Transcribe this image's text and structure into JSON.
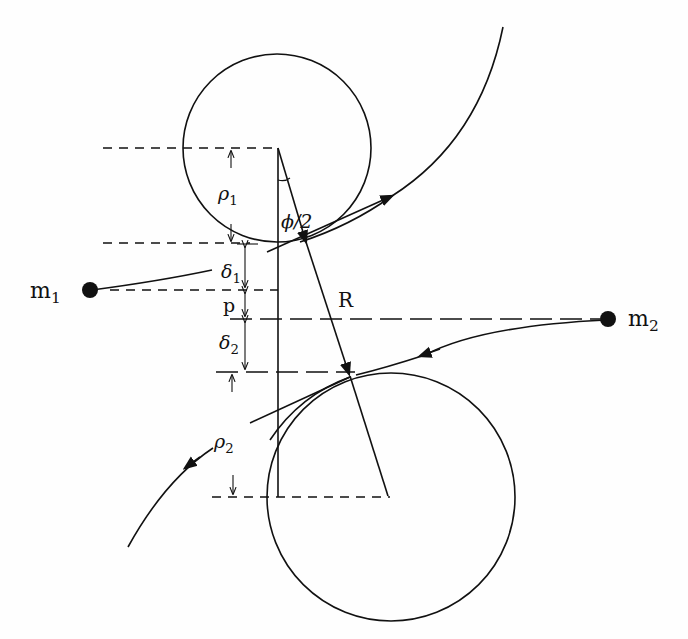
{
  "diagram": {
    "type": "two-body hyperbolic scattering geometry",
    "labels": {
      "m1": {
        "base": "m",
        "sub": "1"
      },
      "m2": {
        "base": "m",
        "sub": "2"
      },
      "rho1": {
        "base": "ρ",
        "sub": "1"
      },
      "rho2": {
        "base": "ρ",
        "sub": "2"
      },
      "delta1": {
        "base": "δ",
        "sub": "1"
      },
      "delta2": {
        "base": "δ",
        "sub": "2"
      },
      "p": "p",
      "R": "R",
      "half_angle": "ϕ/2"
    },
    "elements": {
      "circle_top": {
        "cx": 277,
        "cy": 148,
        "r": 94
      },
      "circle_bottom": {
        "cx": 391,
        "cy": 497,
        "r": 124
      },
      "mass_1": {
        "x": 90,
        "y": 290
      },
      "mass_2": {
        "x": 608,
        "y": 319
      },
      "separation_vector_R": {
        "from": [
          306,
          240
        ],
        "to": [
          350,
          376
        ]
      }
    },
    "colors": {
      "ink": "#111111",
      "paper": "#fefefe"
    }
  }
}
